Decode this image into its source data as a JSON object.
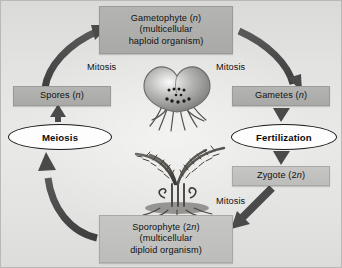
{
  "diagram": {
    "background_top_color": "#dedede",
    "background_bottom_color": "#e5e5e3",
    "box_fill_color": "#aeaeac",
    "arrow_color": "#4a4a4a",
    "ellipse_fill_color": "#fdfdfd"
  },
  "nodes": {
    "gametophyte": {
      "line1": "Gametophyte (n)",
      "line2": "(multicellular",
      "line3": "haploid organism)",
      "ploidy": "n"
    },
    "sporophyte": {
      "line1": "Sporophyte (2n)",
      "line2": "(multicellular",
      "line3": "diploid organism)",
      "ploidy": "2n"
    },
    "spores": {
      "label": "Spores (n)",
      "ploidy": "n"
    },
    "gametes": {
      "label": "Gametes (n)",
      "ploidy": "n"
    },
    "zygote": {
      "label": "Zygote (2n)",
      "ploidy": "2n"
    }
  },
  "processes": {
    "meiosis": {
      "label": "Meiosis"
    },
    "fertilization": {
      "label": "Fertilization"
    },
    "mitosis_spores_to_gametophyte": {
      "label": "Mitosis"
    },
    "mitosis_gametophyte_to_gametes": {
      "label": "Mitosis"
    },
    "mitosis_zygote_to_sporophyte": {
      "label": "Mitosis"
    }
  },
  "illustrations": {
    "gametophyte_image": {
      "name": "heart-shaped-prothallus",
      "description": "heart-shaped fern gametophyte with rhizoids"
    },
    "sporophyte_image": {
      "name": "fern-plant",
      "description": "mature fern sporophyte with arching fronds and fiddleheads"
    }
  }
}
